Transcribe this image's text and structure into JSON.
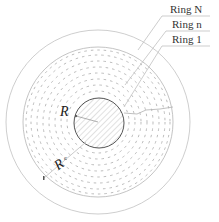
{
  "diagram": {
    "colors": {
      "background": "#ffffff",
      "outline": "#b9b9b9",
      "core_outline": "#555555",
      "hatch": "#c4c4c4",
      "dashed_rings": "#b3b3b3",
      "leader": "#bdbdbd",
      "text": "#333333"
    },
    "labels": {
      "ring_N": "Ring N",
      "ring_n": "Ring n",
      "ring_1": "Ring 1",
      "core_radius_symbol": "R",
      "core_radius_subscript": "",
      "outer_radius_symbol": "R",
      "outer_radius_subscript": "c"
    },
    "geometry": {
      "center": [
        98,
        122
      ],
      "outer_circle_radius": 92,
      "boundary_circle_radius": 75,
      "core_radius": 25,
      "dashed_ring_radii": [
        31,
        37,
        43,
        49,
        55,
        61,
        67,
        72
      ]
    }
  }
}
